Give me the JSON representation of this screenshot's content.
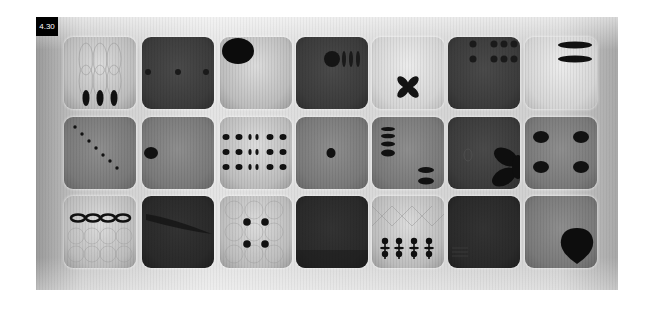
{
  "figure": {
    "label": "4.30",
    "grid": {
      "rows": 3,
      "columns": 7
    },
    "tiles": [
      {
        "row": 1,
        "col": 1,
        "tone": "light",
        "pattern": "three vertical ellipses at bottom, faint curve lines"
      },
      {
        "row": 1,
        "col": 2,
        "tone": "dark",
        "pattern": "three small dots across middle"
      },
      {
        "row": 1,
        "col": 3,
        "tone": "light",
        "pattern": "large ellipse top-left"
      },
      {
        "row": 1,
        "col": 4,
        "tone": "dark",
        "pattern": "circle with three vertical bars top-right"
      },
      {
        "row": 1,
        "col": 5,
        "tone": "vlight",
        "pattern": "four-lobed cross in lower center"
      },
      {
        "row": 1,
        "col": 6,
        "tone": "dark",
        "pattern": "two rows of dots at top"
      },
      {
        "row": 1,
        "col": 7,
        "tone": "vlight",
        "pattern": "two horizontal ellipses top-right"
      },
      {
        "row": 2,
        "col": 1,
        "tone": "mid",
        "pattern": "diagonal line of seven dots"
      },
      {
        "row": 2,
        "col": 2,
        "tone": "mid",
        "pattern": "single ellipse at left edge"
      },
      {
        "row": 2,
        "col": 3,
        "tone": "light",
        "pattern": "3x6 grid of dots"
      },
      {
        "row": 2,
        "col": 4,
        "tone": "mid",
        "pattern": "single dot at center"
      },
      {
        "row": 2,
        "col": 5,
        "tone": "mid",
        "pattern": "stack of four ellipses left, two ellipses bottom-right"
      },
      {
        "row": 2,
        "col": 6,
        "tone": "dark",
        "pattern": "three-petal propeller at right"
      },
      {
        "row": 2,
        "col": 7,
        "tone": "mid",
        "pattern": "four ellipses in square arrangement"
      },
      {
        "row": 3,
        "col": 1,
        "tone": "light",
        "pattern": "chain of four linked ellipses, circle pattern"
      },
      {
        "row": 3,
        "col": 2,
        "tone": "vdark",
        "pattern": "faint diagonal streak"
      },
      {
        "row": 3,
        "col": 3,
        "tone": "light",
        "pattern": "four dots in square, circle pattern"
      },
      {
        "row": 3,
        "col": 4,
        "tone": "vdark",
        "pattern": "plain dark"
      },
      {
        "row": 3,
        "col": 5,
        "tone": "light",
        "pattern": "four figure shapes at bottom"
      },
      {
        "row": 3,
        "col": 6,
        "tone": "vdark",
        "pattern": "plain dark, faint lines bottom-left"
      },
      {
        "row": 3,
        "col": 7,
        "tone": "mid",
        "pattern": "teardrop blob bottom-right"
      }
    ]
  }
}
